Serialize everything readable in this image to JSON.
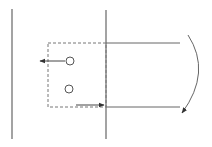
{
  "diagram": {
    "background": "#ffffff",
    "stroke_color": "#555555",
    "vertical_lines": [
      {
        "id": "left-wall",
        "x": 12,
        "y1": 9,
        "y2": 139
      },
      {
        "id": "middle-wall",
        "x": 106,
        "y1": 10,
        "y2": 139
      }
    ],
    "horizontal_lines": [
      {
        "id": "top-rail",
        "x1": 106,
        "x2": 180,
        "y": 43
      },
      {
        "id": "bottom-rail",
        "x1": 106,
        "x2": 180,
        "y": 107
      }
    ],
    "dashed_box": {
      "x": 48,
      "y": 43,
      "width": 58,
      "height": 64
    },
    "circles": [
      {
        "id": "upper-circle",
        "cx": 70,
        "cy": 61,
        "r": 4
      },
      {
        "id": "lower-circle",
        "cx": 69,
        "cy": 89,
        "r": 4
      }
    ],
    "arrows": [
      {
        "id": "left-arrow",
        "x1": 65,
        "y1": 61,
        "x2": 40,
        "y2": 61,
        "direction": "left"
      },
      {
        "id": "right-arrow",
        "x1": 76,
        "y1": 105,
        "x2": 104,
        "y2": 105,
        "direction": "right"
      }
    ],
    "curved_arrow": {
      "id": "rotation-arrow",
      "path": "M188 35 Q212 72 182 113",
      "direction": "clockwise-down"
    }
  }
}
